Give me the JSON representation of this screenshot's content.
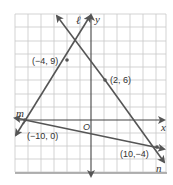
{
  "diagram": {
    "type": "coordinate-plane",
    "axes": {
      "x_label": "x",
      "y_label": "y",
      "origin_label": "O"
    },
    "grid": {
      "unit_per_square": 2,
      "x_range": [
        -11,
        11
      ],
      "y_range": [
        -8,
        16
      ]
    },
    "lines": [
      {
        "name": "ℓ",
        "points": [
          [
            -10,
            0
          ],
          [
            -4,
            9
          ]
        ]
      },
      {
        "name": "m",
        "points": [
          [
            -10,
            0
          ],
          [
            10,
            -4
          ]
        ]
      },
      {
        "name": "n",
        "points": [
          [
            2,
            6
          ],
          [
            10,
            -4
          ]
        ]
      }
    ],
    "points": [
      {
        "label": "(−4, 9)",
        "x": -4,
        "y": 9
      },
      {
        "label": "(2, 6)",
        "x": 2,
        "y": 6
      },
      {
        "label": "(−10, 0)",
        "x": -10,
        "y": 0
      },
      {
        "label": "(10,−4)",
        "x": 10,
        "y": -4
      }
    ],
    "colors": {
      "line": "#555555",
      "grid": "#c8c8c8",
      "axis": "#444444"
    }
  }
}
